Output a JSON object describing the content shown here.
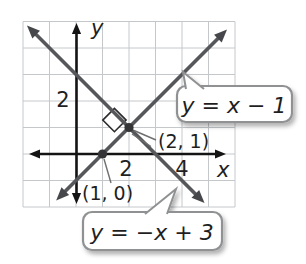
{
  "chart_data": {
    "type": "line",
    "title": "",
    "axes": {
      "x_label": "x",
      "y_label": "y",
      "x_range": [
        -2,
        6
      ],
      "y_range": [
        -2,
        5
      ],
      "grid": true,
      "x_ticks": [
        {
          "value": 2,
          "label": "2"
        },
        {
          "value": 4,
          "label": "4"
        }
      ],
      "y_ticks": [
        {
          "value": 2,
          "label": "2"
        }
      ]
    },
    "series": [
      {
        "name": "y = x − 1",
        "slope": 1,
        "y_intercept": -1,
        "draw_ends": [
          [
            -0.75,
            -1.75
          ],
          [
            5.7,
            4.7
          ]
        ]
      },
      {
        "name": "y = −x + 3",
        "slope": -1,
        "y_intercept": 3,
        "draw_ends": [
          [
            -1.85,
            4.85
          ],
          [
            4.85,
            -1.85
          ]
        ]
      }
    ],
    "marked_points": [
      {
        "label": "(1, 0)",
        "x": 1,
        "y": 0
      },
      {
        "label": "(2, 1)",
        "x": 2,
        "y": 1
      }
    ],
    "intersection": {
      "x": 2,
      "y": 1
    },
    "perpendicular": true,
    "right_angle_marker": {
      "center": [
        1.45,
        1.28
      ],
      "half_diagonal": 0.44
    },
    "callouts": [
      {
        "text": "y = x − 1",
        "points_to_series": 0
      },
      {
        "text": "y = −x + 3",
        "points_to_series": 1
      }
    ],
    "colors": {
      "line": "#56575a",
      "axis": "#141414",
      "grid": "#c5c8cb",
      "callout_border": "#8f9193",
      "callout_fill": "#ffffff",
      "text": "#1f1f1f"
    }
  }
}
